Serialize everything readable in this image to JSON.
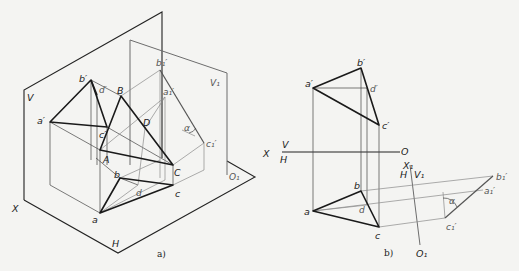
{
  "figure_a": {
    "caption": "a)",
    "planes": {
      "V": "V",
      "H": "H",
      "V1": "V₁",
      "X": "X",
      "O1": "O₁"
    },
    "points_space": {
      "A": "A",
      "B": "B",
      "C": "C",
      "D": "D"
    },
    "points_front": {
      "a": "a′",
      "b": "b′",
      "c": "c′",
      "d": "d′"
    },
    "points_top": {
      "a": "a",
      "b": "b",
      "c": "c",
      "d": "d"
    },
    "points_aux": {
      "a": "a₁′",
      "b": "b₁′",
      "c": "c₁′"
    },
    "angle": "α"
  },
  "figure_b": {
    "caption": "b)",
    "axis": {
      "X": "X",
      "V": "V",
      "H": "H",
      "O": "O",
      "X1": "X₁",
      "H1": "H",
      "V1": "V₁",
      "O1": "O₁"
    },
    "points_front": {
      "a": "a′",
      "b": "b′",
      "c": "c′",
      "d": "d′"
    },
    "points_top": {
      "a": "a",
      "b": "b",
      "c": "c",
      "d": "d"
    },
    "points_aux": {
      "a": "a₁′",
      "b": "b₁′",
      "c": "c₁′"
    },
    "angle": "α"
  }
}
